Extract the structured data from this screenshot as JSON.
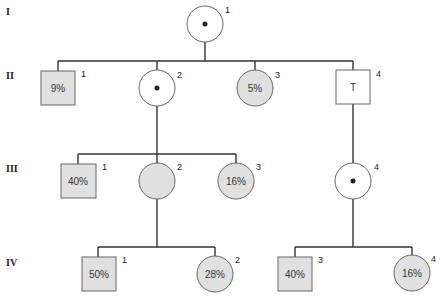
{
  "colors": {
    "affected_fill": "#e0e0e0",
    "unaffected_fill": "#ffffff",
    "stroke": "#666666",
    "line": "#333333"
  },
  "generations": [
    {
      "label": "I"
    },
    {
      "label": "II"
    },
    {
      "label": "III"
    },
    {
      "label": "IV"
    }
  ],
  "individuals": {
    "I1": {
      "number": "1",
      "sex": "female",
      "status": "carrier",
      "text": ""
    },
    "II1": {
      "number": "1",
      "sex": "male",
      "status": "shaded",
      "text": "9%"
    },
    "II2": {
      "number": "2",
      "sex": "female",
      "status": "carrier",
      "text": ""
    },
    "II3": {
      "number": "3",
      "sex": "female",
      "status": "shaded",
      "text": "5%"
    },
    "II4": {
      "number": "4",
      "sex": "male",
      "status": "unaffected",
      "text": "T"
    },
    "III1": {
      "number": "1",
      "sex": "male",
      "status": "shaded",
      "text": "40%"
    },
    "III2": {
      "number": "2",
      "sex": "female",
      "status": "shaded",
      "text": ""
    },
    "III3": {
      "number": "3",
      "sex": "female",
      "status": "shaded",
      "text": "16%"
    },
    "III4": {
      "number": "4",
      "sex": "female",
      "status": "carrier",
      "text": ""
    },
    "IV1": {
      "number": "1",
      "sex": "male",
      "status": "shaded",
      "text": "50%"
    },
    "IV2": {
      "number": "2",
      "sex": "female",
      "status": "shaded",
      "text": "28%"
    },
    "IV3": {
      "number": "3",
      "sex": "male",
      "status": "shaded",
      "text": "40%"
    },
    "IV4": {
      "number": "4",
      "sex": "female",
      "status": "shaded",
      "text": "16%"
    }
  }
}
